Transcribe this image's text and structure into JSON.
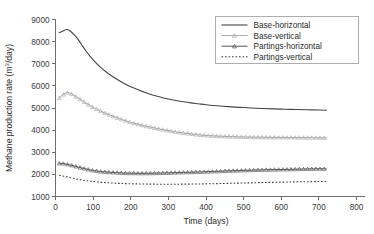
{
  "chart_data": {
    "type": "line",
    "title": "",
    "xlabel": "Time (days)",
    "ylabel": "Methane production rate (m3/day)",
    "ylabel_parts": {
      "prefix": "Methane production rate (m",
      "superscript": "3",
      "suffix": "/day)"
    },
    "xlim": [
      0,
      800
    ],
    "ylim": [
      1000,
      9000
    ],
    "xticks": [
      0,
      100,
      200,
      300,
      400,
      500,
      600,
      700,
      800
    ],
    "yticks": [
      1000,
      2000,
      3000,
      4000,
      5000,
      6000,
      7000,
      8000,
      9000
    ],
    "xtick_labels": [
      "0",
      "100",
      "200",
      "300",
      "400",
      "500",
      "600",
      "700",
      "800"
    ],
    "ytick_labels": [
      "1000",
      "2000",
      "3000",
      "4000",
      "5000",
      "6000",
      "7000",
      "8000",
      "9000"
    ],
    "grid": false,
    "legend_position": "top-right",
    "series": [
      {
        "name": "Base-horizontal",
        "color": "#444444",
        "style": "solid",
        "marker": "none",
        "line_width": 1.1,
        "x": [
          10,
          20,
          30,
          40,
          50,
          60,
          70,
          80,
          90,
          100,
          120,
          140,
          160,
          180,
          200,
          220,
          240,
          260,
          280,
          300,
          320,
          340,
          360,
          380,
          400,
          430,
          460,
          490,
          520,
          550,
          580,
          610,
          640,
          670,
          700,
          720
        ],
        "y": [
          8400,
          8480,
          8550,
          8470,
          8300,
          8100,
          7850,
          7600,
          7380,
          7180,
          6840,
          6560,
          6330,
          6130,
          5960,
          5820,
          5690,
          5580,
          5490,
          5410,
          5340,
          5280,
          5230,
          5190,
          5150,
          5100,
          5060,
          5030,
          5000,
          4980,
          4960,
          4945,
          4930,
          4920,
          4910,
          4900
        ]
      },
      {
        "name": "Base-vertical",
        "color": "#a8a8a8",
        "style": "solid",
        "marker": "triangle",
        "line_width": 1.0,
        "x": [
          10,
          20,
          30,
          40,
          50,
          60,
          70,
          80,
          90,
          100,
          120,
          140,
          160,
          180,
          200,
          220,
          240,
          260,
          280,
          300,
          320,
          340,
          360,
          380,
          400,
          430,
          460,
          490,
          520,
          550,
          580,
          610,
          640,
          670,
          700,
          720
        ],
        "y": [
          5450,
          5600,
          5700,
          5660,
          5560,
          5450,
          5340,
          5230,
          5130,
          5030,
          4860,
          4710,
          4580,
          4460,
          4350,
          4260,
          4180,
          4110,
          4040,
          3980,
          3920,
          3870,
          3830,
          3790,
          3760,
          3730,
          3710,
          3695,
          3685,
          3678,
          3672,
          3668,
          3664,
          3660,
          3656,
          3650
        ]
      },
      {
        "name": "Partings-horizontal",
        "color": "#555555",
        "style": "solid",
        "marker": "triangle",
        "line_width": 1.0,
        "x": [
          10,
          20,
          30,
          40,
          50,
          60,
          70,
          80,
          90,
          100,
          120,
          140,
          160,
          180,
          200,
          220,
          240,
          260,
          280,
          300,
          320,
          340,
          360,
          380,
          400,
          430,
          460,
          490,
          520,
          550,
          580,
          610,
          640,
          670,
          700,
          720
        ],
        "y": [
          2500,
          2490,
          2460,
          2420,
          2380,
          2330,
          2290,
          2250,
          2210,
          2180,
          2130,
          2100,
          2080,
          2065,
          2055,
          2050,
          2050,
          2055,
          2062,
          2070,
          2080,
          2090,
          2100,
          2110,
          2120,
          2140,
          2160,
          2175,
          2190,
          2205,
          2215,
          2225,
          2235,
          2245,
          2255,
          2250
        ]
      },
      {
        "name": "Partings-vertical",
        "color": "#3a3a3a",
        "style": "dotted",
        "marker": "none",
        "line_width": 1.1,
        "x": [
          10,
          20,
          30,
          40,
          50,
          60,
          70,
          80,
          90,
          100,
          120,
          140,
          160,
          180,
          200,
          220,
          240,
          260,
          280,
          300,
          320,
          340,
          360,
          380,
          400,
          430,
          460,
          490,
          520,
          550,
          580,
          610,
          640,
          670,
          700,
          720
        ],
        "y": [
          1960,
          1930,
          1890,
          1850,
          1810,
          1775,
          1745,
          1720,
          1695,
          1675,
          1645,
          1620,
          1600,
          1585,
          1575,
          1568,
          1562,
          1558,
          1556,
          1555,
          1556,
          1558,
          1562,
          1566,
          1572,
          1582,
          1594,
          1606,
          1618,
          1630,
          1642,
          1652,
          1662,
          1670,
          1676,
          1680
        ]
      }
    ]
  },
  "legend": {
    "entries": [
      {
        "label": "Base-horizontal"
      },
      {
        "label": "Base-vertical"
      },
      {
        "label": "Partings-horizontal"
      },
      {
        "label": "Partings-vertical"
      }
    ]
  }
}
